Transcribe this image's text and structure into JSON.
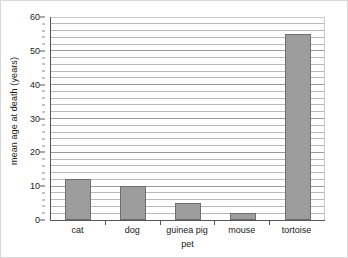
{
  "chart_data": {
    "type": "bar",
    "title": "",
    "categories": [
      "cat",
      "dog",
      "guinea pig",
      "mouse",
      "tortoise"
    ],
    "values": [
      12,
      10,
      5,
      2,
      55
    ],
    "xlabel": "pet",
    "ylabel": "mean age at death (years)",
    "ylim": [
      0,
      60
    ],
    "ytick_labels": [
      "0",
      "10",
      "20",
      "30",
      "40",
      "50",
      "60"
    ],
    "ytick_values": [
      0,
      10,
      20,
      30,
      40,
      50,
      60
    ],
    "minor_gridline_step": 2,
    "grid": true,
    "legend": null,
    "bar_color": "#9d9d9d",
    "bar_edge_color": "#6f6f6f",
    "gridline_color": "#b9b9b9",
    "axis_color": "#555555"
  }
}
